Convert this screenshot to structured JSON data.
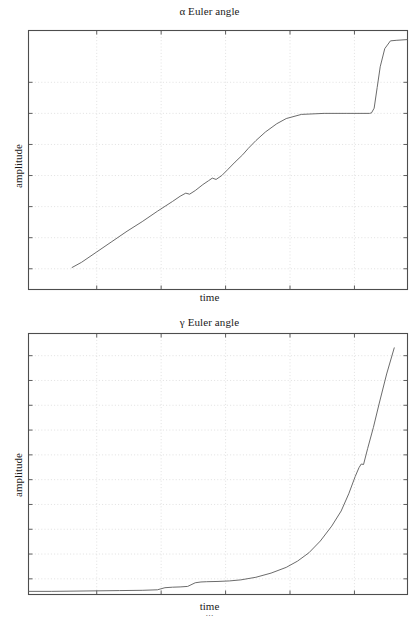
{
  "page": {
    "width": 419,
    "height": 617,
    "background": "#ffffff",
    "ink_color": "#555555",
    "frame_color": "#4d4d4d",
    "grid_color": "#d9d9d9"
  },
  "figures": [
    {
      "id": "alpha",
      "title": "α Euler angle",
      "xlabel": "time",
      "ylabel": "amplitude"
    },
    {
      "id": "gamma",
      "title": "γ Euler angle",
      "xlabel": "time",
      "ylabel": "amplitude"
    }
  ],
  "caption": {
    "text": "…"
  },
  "chart_data": [
    {
      "type": "line",
      "id": "alpha",
      "title": "α Euler angle",
      "xlabel": "time",
      "ylabel": "amplitude",
      "legend": null,
      "grid": true,
      "grid_style": "dotted",
      "xlim": [
        0,
        1
      ],
      "ylim": [
        0,
        1
      ],
      "xticks": [
        0.18,
        0.35,
        0.52,
        0.69,
        0.86
      ],
      "xticklabels": [],
      "yticks": [
        0.08,
        0.2,
        0.32,
        0.44,
        0.56,
        0.68,
        0.8
      ],
      "yticklabels": [],
      "series": [
        {
          "name": "alpha",
          "color": "#5a5a5a",
          "x": [
            0.115,
            0.14,
            0.18,
            0.22,
            0.26,
            0.3,
            0.34,
            0.38,
            0.4,
            0.415,
            0.425,
            0.44,
            0.46,
            0.475,
            0.485,
            0.495,
            0.51,
            0.525,
            0.545,
            0.565,
            0.58,
            0.6,
            0.625,
            0.655,
            0.68,
            0.72,
            0.78,
            0.84,
            0.88,
            0.9,
            0.905,
            0.912,
            0.92,
            0.928,
            0.94,
            0.955,
            0.97,
            1.0
          ],
          "y": [
            0.085,
            0.105,
            0.145,
            0.185,
            0.225,
            0.262,
            0.302,
            0.34,
            0.36,
            0.372,
            0.368,
            0.382,
            0.405,
            0.42,
            0.43,
            0.425,
            0.44,
            0.462,
            0.492,
            0.52,
            0.545,
            0.575,
            0.608,
            0.64,
            0.66,
            0.676,
            0.68,
            0.68,
            0.68,
            0.68,
            0.682,
            0.7,
            0.78,
            0.86,
            0.93,
            0.96,
            0.962,
            0.965
          ]
        }
      ]
    },
    {
      "type": "line",
      "id": "gamma",
      "title": "γ Euler angle",
      "xlabel": "time",
      "ylabel": "amplitude",
      "legend": null,
      "grid": true,
      "grid_style": "dotted",
      "xlim": [
        0,
        1
      ],
      "ylim": [
        0,
        1
      ],
      "xticks": [
        0.18,
        0.35,
        0.52,
        0.69,
        0.86
      ],
      "xticklabels": [],
      "yticks": [
        0.06,
        0.155,
        0.25,
        0.345,
        0.44,
        0.535,
        0.63,
        0.725,
        0.82,
        0.915
      ],
      "yticklabels": [],
      "series": [
        {
          "name": "gamma",
          "color": "#5a5a5a",
          "x": [
            0.0,
            0.06,
            0.12,
            0.18,
            0.24,
            0.3,
            0.34,
            0.36,
            0.38,
            0.4,
            0.42,
            0.44,
            0.455,
            0.47,
            0.5,
            0.53,
            0.56,
            0.6,
            0.64,
            0.68,
            0.71,
            0.74,
            0.77,
            0.8,
            0.825,
            0.845,
            0.862,
            0.872,
            0.878,
            0.884,
            0.895,
            0.91,
            0.925,
            0.945,
            0.965
          ],
          "y": [
            0.012,
            0.012,
            0.013,
            0.014,
            0.015,
            0.016,
            0.018,
            0.026,
            0.028,
            0.029,
            0.031,
            0.045,
            0.048,
            0.049,
            0.05,
            0.052,
            0.056,
            0.066,
            0.082,
            0.104,
            0.128,
            0.16,
            0.205,
            0.262,
            0.32,
            0.386,
            0.452,
            0.486,
            0.5,
            0.498,
            0.56,
            0.64,
            0.73,
            0.845,
            0.945
          ]
        }
      ]
    }
  ]
}
